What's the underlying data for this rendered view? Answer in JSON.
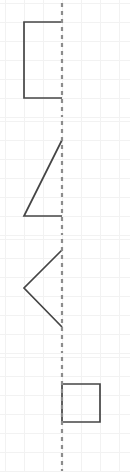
{
  "canvas": {
    "width": 130,
    "height": 472,
    "background": "#ffffff",
    "panel_height": 118,
    "panel_count": 4
  },
  "grid": {
    "cell_size": 19,
    "color": "#f2f2f2",
    "stroke_width": 1,
    "x_positions": [
      5,
      24,
      43,
      62,
      81,
      100,
      119
    ],
    "y_positions": [
      3,
      22,
      41,
      60,
      79,
      98,
      117
    ],
    "visible": true
  },
  "mirror_line": {
    "name": "mirror-line",
    "color": "#8c8c8c",
    "stroke_width": 2.2,
    "dash": "4 4",
    "x": 62,
    "y_start": 3,
    "y_end": 117
  },
  "figure_style": {
    "color": "#454545",
    "stroke_width": 1.7,
    "fill": "none"
  },
  "panels": [
    {
      "index": 0,
      "name": "panel-open-rectangle-left",
      "shape_label": "open-rectangle",
      "points": "62,22 24,22 24,98 62,98",
      "closed": false
    },
    {
      "index": 1,
      "name": "panel-right-triangle-left",
      "shape_label": "open-triangle",
      "points": "62,22 24,98 62,98",
      "closed": false
    },
    {
      "index": 2,
      "name": "panel-chevron-left",
      "shape_label": "chevron",
      "points": "62,14 24,52 62,91",
      "closed": false
    },
    {
      "index": 3,
      "name": "panel-square-right",
      "shape_label": "square",
      "points": "62,30 100,30 100,68 62,68",
      "closed": true
    }
  ]
}
